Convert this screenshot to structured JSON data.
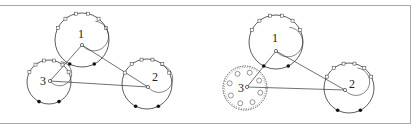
{
  "figure": {
    "panels": [
      {
        "id": "left",
        "nodes": [
          {
            "label": "1",
            "cx": 82,
            "cy": 40,
            "r": 27,
            "dot": [
              82,
              45
            ],
            "label_pos": [
              78,
              38
            ],
            "textured": false
          },
          {
            "label": "2",
            "cx": 147,
            "cy": 84,
            "r": 25,
            "dot": [
              148,
              87
            ],
            "label_pos": [
              152,
              81
            ],
            "textured": false
          },
          {
            "label": "3",
            "cx": 49,
            "cy": 82,
            "r": 22,
            "dot": [
              50,
              81
            ],
            "label_pos": [
              40,
              85
            ],
            "textured": false
          }
        ],
        "edges": [
          [
            0,
            1
          ],
          [
            0,
            2
          ],
          [
            1,
            2
          ]
        ]
      },
      {
        "id": "right",
        "nodes": [
          {
            "label": "1",
            "cx": 276,
            "cy": 42,
            "r": 27,
            "dot": [
              276,
              51
            ],
            "label_pos": [
              272,
              42
            ],
            "textured": false
          },
          {
            "label": "2",
            "cx": 349,
            "cy": 88,
            "r": 25,
            "dot": [
              345,
              90
            ],
            "label_pos": [
              349,
              88
            ],
            "textured": false
          },
          {
            "label": "3",
            "cx": 245,
            "cy": 88,
            "r": 22,
            "dot": [
              247,
              87
            ],
            "label_pos": [
              238,
              92
            ],
            "textured": true
          }
        ],
        "edges": [
          [
            0,
            1
          ],
          [
            0,
            2
          ],
          [
            1,
            2
          ]
        ]
      }
    ],
    "colors": {
      "stroke": "#333333",
      "frame": "#a8a8a8",
      "dot_fill": "#111111"
    }
  }
}
